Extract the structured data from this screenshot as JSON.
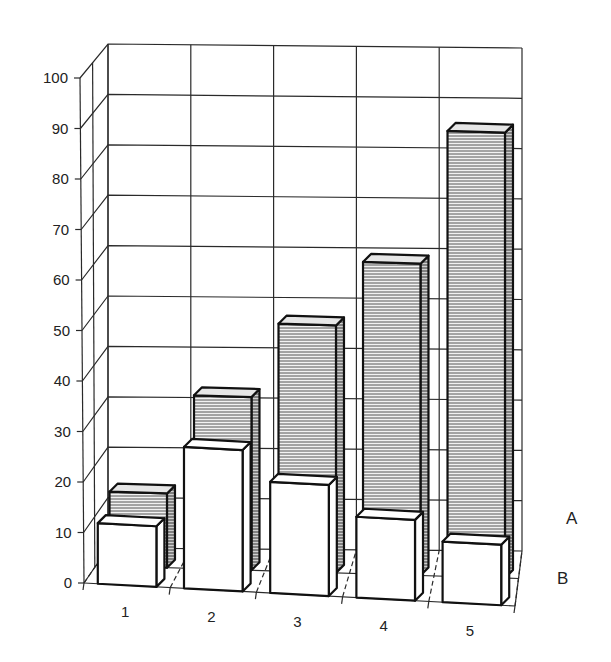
{
  "chart_data": {
    "type": "bar",
    "subtype": "3d-clustered-depth",
    "title": "",
    "xlabel": "",
    "ylabel": "",
    "categories": [
      "1",
      "2",
      "3",
      "4",
      "5"
    ],
    "series": [
      {
        "name": "A",
        "values": [
          15,
          35,
          50,
          63,
          90
        ],
        "fill": "hatched-gray",
        "row": "back"
      },
      {
        "name": "B",
        "values": [
          12,
          28,
          22,
          16,
          12
        ],
        "fill": "#ffffff",
        "row": "front"
      }
    ],
    "ylim": [
      0,
      100
    ],
    "yticks": [
      0,
      10,
      20,
      30,
      40,
      50,
      60,
      70,
      80,
      90,
      100
    ],
    "grid": true,
    "legend_position": "series labels on depth axis (right)"
  },
  "axis": {
    "y_tick_labels": [
      "0",
      "10",
      "20",
      "30",
      "40",
      "50",
      "60",
      "70",
      "80",
      "90",
      "100"
    ],
    "x_tick_labels": [
      "1",
      "2",
      "3",
      "4",
      "5"
    ],
    "depth_labels": [
      "A",
      "B"
    ]
  },
  "colors": {
    "background": "#ffffff",
    "line": "#111111",
    "grid": "#2a2a2a",
    "hatch": "#555555",
    "front_fill": "#ffffff"
  }
}
